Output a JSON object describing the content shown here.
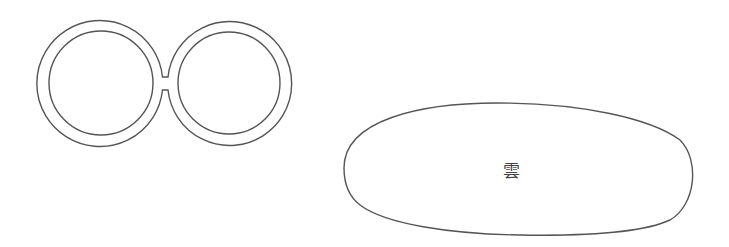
{
  "figure": {
    "background": "#ffffff",
    "stroke_color": "#555555",
    "shapes": [
      {
        "id": "glasses",
        "kind": "two-ring spectacles shape",
        "left_ring": {
          "cx": 101,
          "cy": 83,
          "outer_r": 63,
          "inner_r": 52
        },
        "right_ring": {
          "cx": 229,
          "cy": 83,
          "outer_r": 62,
          "inner_r": 51
        },
        "bridge": {
          "x1": 162,
          "x2": 169,
          "y_top": 77,
          "y_bottom": 90
        }
      },
      {
        "id": "cloud",
        "kind": "rounded blob outline",
        "bounds": {
          "left": 344,
          "top": 103,
          "right": 693,
          "bottom": 235
        },
        "label": "雲"
      }
    ]
  }
}
